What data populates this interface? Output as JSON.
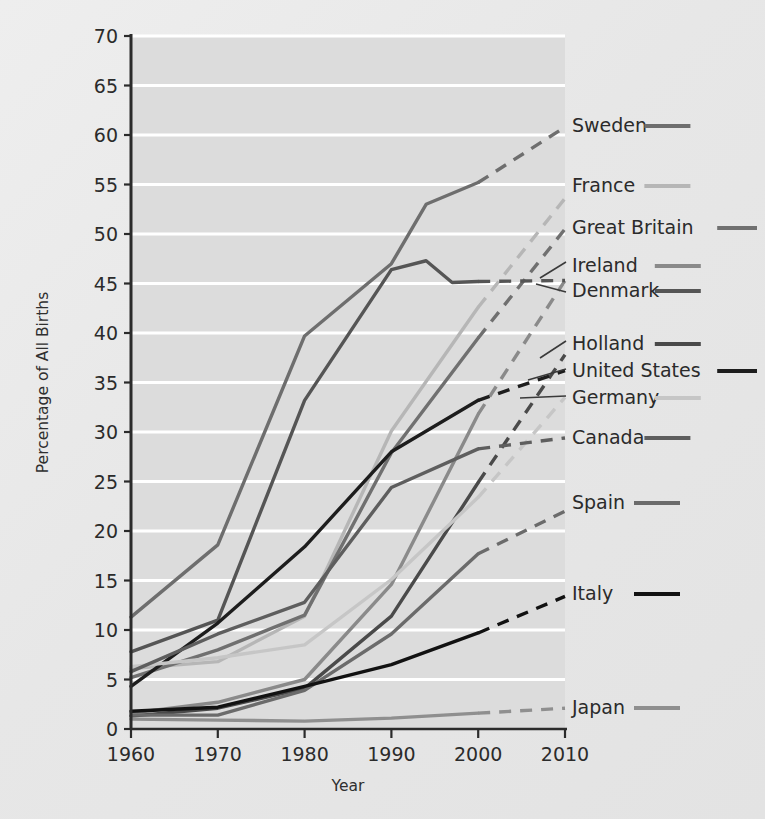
{
  "chart_data": {
    "type": "line",
    "title": "",
    "xlabel": "Year",
    "ylabel": "Percentage of All Births",
    "x": [
      1960,
      1970,
      1980,
      1990,
      2000,
      2010
    ],
    "xlim": [
      1960,
      2010
    ],
    "ylim": [
      0,
      70
    ],
    "ytick_step": 5,
    "yticks": [
      "0",
      "5",
      "10",
      "15",
      "20",
      "25",
      "30",
      "35",
      "40",
      "45",
      "50",
      "55",
      "60",
      "65",
      "70"
    ],
    "xticks": [
      "1960",
      "1970",
      "1980",
      "1990",
      "2000",
      "2010"
    ],
    "grid": "horizontal-white-lines",
    "legend_position": "right",
    "note": "Solid segments are observed data; dashed segments are projections/extrapolations.",
    "series": [
      {
        "name": "Sweden",
        "color": "#6e6e6e",
        "width": 3.4,
        "points": [
          [
            1960,
            11.3
          ],
          [
            1970,
            18.6
          ],
          [
            1980,
            39.7
          ],
          [
            1990,
            47.0
          ],
          [
            1994,
            53.0
          ],
          [
            2000,
            55.2
          ],
          [
            2010,
            60.8
          ]
        ],
        "dash_from": 2000
      },
      {
        "name": "France",
        "color": "#b6b6b6",
        "width": 3.4,
        "points": [
          [
            1960,
            6.1
          ],
          [
            1970,
            6.8
          ],
          [
            1980,
            11.4
          ],
          [
            1990,
            30.1
          ],
          [
            2000,
            42.6
          ],
          [
            2010,
            53.6
          ]
        ],
        "dash_from": 2000
      },
      {
        "name": "Great Britain",
        "color": "#707070",
        "width": 3.4,
        "points": [
          [
            1960,
            5.2
          ],
          [
            1970,
            8.0
          ],
          [
            1980,
            11.5
          ],
          [
            1990,
            27.9
          ],
          [
            2000,
            39.5
          ],
          [
            2010,
            50.5
          ]
        ],
        "dash_from": 2000
      },
      {
        "name": "Ireland",
        "color": "#8a8a8a",
        "width": 3.4,
        "points": [
          [
            1960,
            1.6
          ],
          [
            1970,
            2.7
          ],
          [
            1980,
            5.0
          ],
          [
            1990,
            14.6
          ],
          [
            2000,
            31.8
          ],
          [
            2010,
            45.3
          ]
        ],
        "dash_from": 2000
      },
      {
        "name": "Denmark",
        "color": "#555555",
        "width": 3.4,
        "points": [
          [
            1960,
            7.8
          ],
          [
            1970,
            11.0
          ],
          [
            1980,
            33.2
          ],
          [
            1990,
            46.4
          ],
          [
            1994,
            47.3
          ],
          [
            1997,
            45.1
          ],
          [
            2000,
            45.2
          ],
          [
            2010,
            45.3
          ]
        ],
        "dash_from": 2000
      },
      {
        "name": "Holland",
        "color": "#4a4a4a",
        "width": 3.4,
        "points": [
          [
            1960,
            1.3
          ],
          [
            1970,
            2.1
          ],
          [
            1980,
            4.1
          ],
          [
            1990,
            11.4
          ],
          [
            2000,
            24.9
          ],
          [
            2010,
            37.8
          ]
        ],
        "dash_from": 2000
      },
      {
        "name": "United States",
        "color": "#1d1d1d",
        "width": 3.4,
        "points": [
          [
            1960,
            4.3
          ],
          [
            1970,
            10.7
          ],
          [
            1980,
            18.4
          ],
          [
            1990,
            28.0
          ],
          [
            2000,
            33.2
          ],
          [
            2010,
            36.2
          ]
        ],
        "dash_from": 2000
      },
      {
        "name": "Germany",
        "color": "#c6c6c6",
        "width": 3.4,
        "points": [
          [
            1960,
            6.3
          ],
          [
            1970,
            7.2
          ],
          [
            1980,
            8.5
          ],
          [
            1990,
            15.1
          ],
          [
            2000,
            23.4
          ],
          [
            2010,
            33.5
          ]
        ],
        "dash_from": 2000
      },
      {
        "name": "Canada",
        "color": "#5e5e5e",
        "width": 3.4,
        "points": [
          [
            1960,
            5.8
          ],
          [
            1970,
            9.6
          ],
          [
            1980,
            12.8
          ],
          [
            1990,
            24.4
          ],
          [
            2000,
            28.3
          ],
          [
            2010,
            29.4
          ]
        ],
        "dash_from": 2000
      },
      {
        "name": "Spain",
        "color": "#6b6b6b",
        "width": 3.4,
        "points": [
          [
            1960,
            1.4
          ],
          [
            1970,
            1.4
          ],
          [
            1980,
            3.9
          ],
          [
            1990,
            9.6
          ],
          [
            2000,
            17.7
          ],
          [
            2010,
            22.0
          ]
        ],
        "dash_from": 2000
      },
      {
        "name": "Italy",
        "color": "#121212",
        "width": 3.4,
        "points": [
          [
            1960,
            1.8
          ],
          [
            1970,
            2.2
          ],
          [
            1980,
            4.3
          ],
          [
            1990,
            6.5
          ],
          [
            2000,
            9.7
          ],
          [
            2010,
            13.4
          ]
        ],
        "dash_from": 2000
      },
      {
        "name": "Japan",
        "color": "#8f8f8f",
        "width": 3.4,
        "points": [
          [
            1960,
            1.0
          ],
          [
            1970,
            0.9
          ],
          [
            1980,
            0.8
          ],
          [
            1990,
            1.1
          ],
          [
            2000,
            1.6
          ],
          [
            2010,
            2.1
          ]
        ],
        "dash_from": 2000
      }
    ]
  },
  "legend": {
    "entries": [
      {
        "label": "Sweden",
        "y": 126,
        "color": "#6e6e6e",
        "leader": false
      },
      {
        "label": "France",
        "y": 186,
        "color": "#b6b6b6",
        "leader": false
      },
      {
        "label": "Great Britain",
        "y": 228,
        "color": "#707070",
        "leader": false
      },
      {
        "label": "Ireland",
        "y": 266,
        "color": "#8a8a8a",
        "leader": true
      },
      {
        "label": "Denmark",
        "y": 291,
        "color": "#555555",
        "leader": true
      },
      {
        "label": "Holland",
        "y": 344,
        "color": "#4a4a4a",
        "leader": true
      },
      {
        "label": "United States",
        "y": 371,
        "color": "#1d1d1d",
        "leader": true
      },
      {
        "label": "Germany",
        "y": 398,
        "color": "#c6c6c6",
        "leader": true
      },
      {
        "label": "Canada",
        "y": 438,
        "color": "#5e5e5e",
        "leader": false
      },
      {
        "label": "Spain",
        "y": 503,
        "color": "#6b6b6b",
        "leader": false
      },
      {
        "label": "Italy",
        "y": 594,
        "color": "#121212",
        "leader": false
      },
      {
        "label": "Japan",
        "y": 708,
        "color": "#8f8f8f",
        "leader": false
      }
    ]
  }
}
